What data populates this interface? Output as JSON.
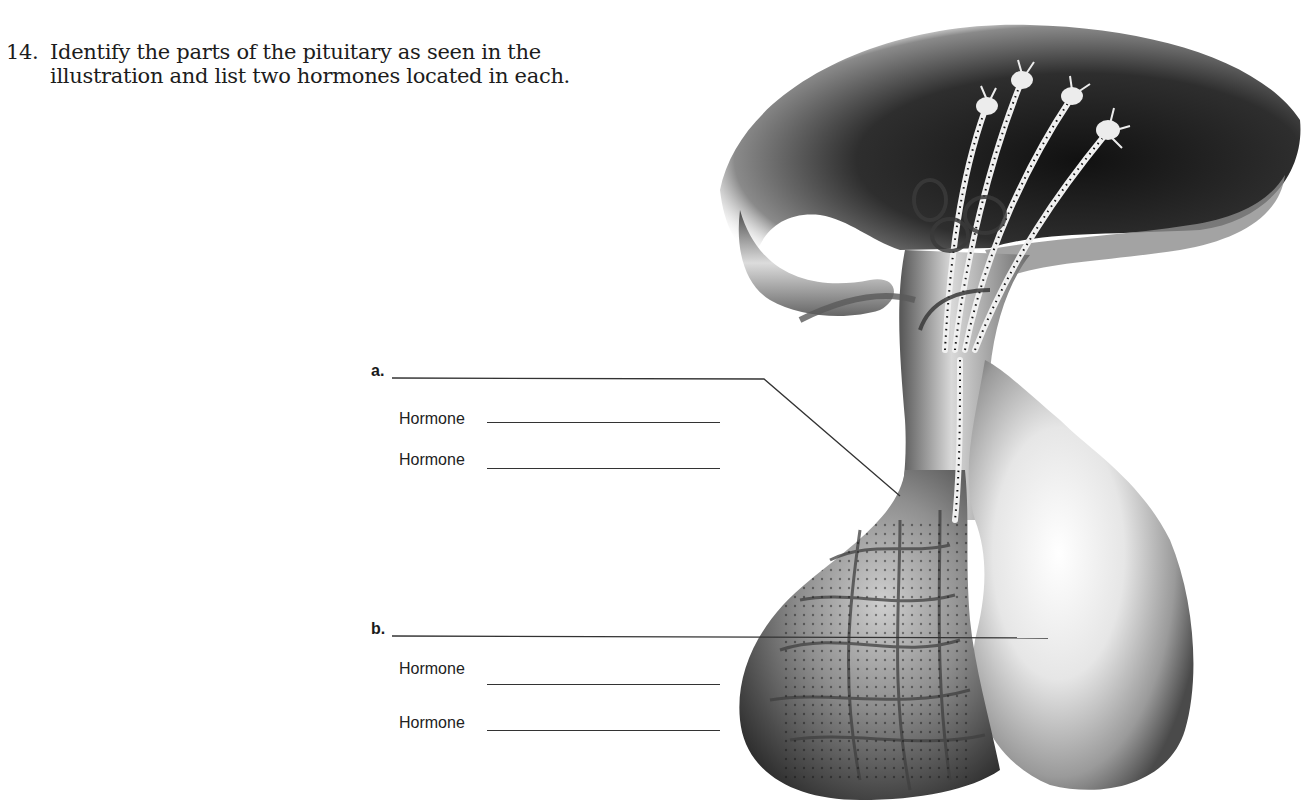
{
  "question": {
    "number": "14.",
    "line1": "Identify the parts of the pituitary as seen in the",
    "line2": "illustration and list two hormones located in each."
  },
  "labels": [
    {
      "letter": "a.",
      "hormone_rows": [
        {
          "label": "Hormone",
          "value": ""
        },
        {
          "label": "Hormone",
          "value": ""
        }
      ]
    },
    {
      "letter": "b.",
      "hormone_rows": [
        {
          "label": "Hormone",
          "value": ""
        },
        {
          "label": "Hormone",
          "value": ""
        }
      ]
    }
  ],
  "illustration": {
    "subject": "pituitary gland with hypothalamus, neurosecretory cells and portal capillary network",
    "colors": {
      "dark": "#2a2a2a",
      "mid": "#7a7a7a",
      "light": "#e8e8e8",
      "line": "#333333"
    }
  }
}
